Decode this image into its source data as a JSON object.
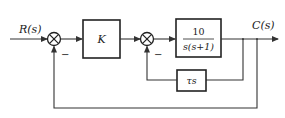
{
  "diagram": {
    "type": "control-system-block-diagram",
    "input": {
      "label": "R(s)"
    },
    "output": {
      "label": "C(s)"
    },
    "summing_junctions": [
      {
        "id": "sum1",
        "inputs": [
          "R(s)",
          "C(s)"
        ],
        "signs": [
          "+",
          "−"
        ],
        "minus_label": "−"
      },
      {
        "id": "sum2",
        "inputs": [
          "K output",
          "τs output"
        ],
        "signs": [
          "+",
          "−"
        ],
        "minus_label": "−"
      }
    ],
    "blocks": [
      {
        "id": "gain",
        "label": "K"
      },
      {
        "id": "plant",
        "numerator": "10",
        "denominator": "s(s+1)"
      },
      {
        "id": "rate_feedback",
        "label": "τs"
      }
    ],
    "connections": [
      "R(s) → sum1 (+)",
      "sum1 → K",
      "K → sum2 (+)",
      "sum2 → 10/s(s+1)",
      "10/s(s+1) → C(s)",
      "C(s) → τs → sum2 (−)",
      "C(s) → sum1 (−)"
    ]
  }
}
